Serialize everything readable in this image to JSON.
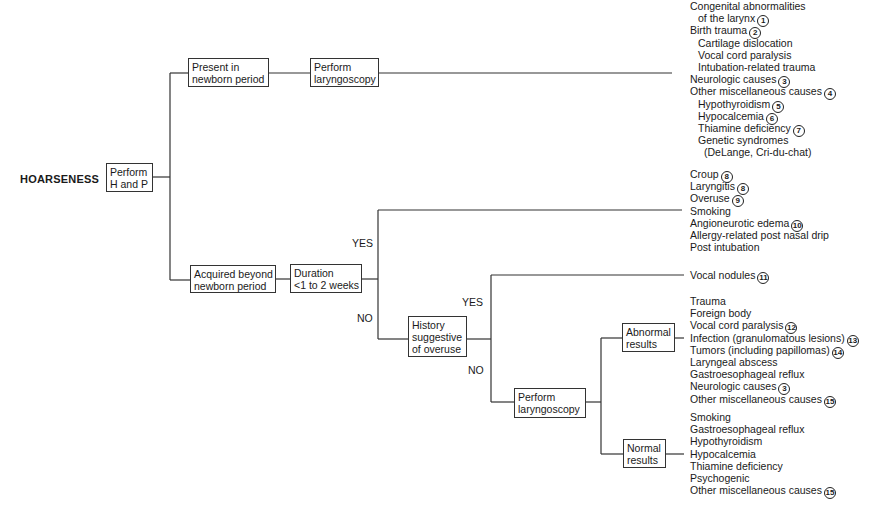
{
  "diagram": {
    "title": "HOARSENESS",
    "nodes": {
      "h_and_p": [
        "Perform",
        "H and P"
      ],
      "newborn": [
        "Present in",
        "newborn period"
      ],
      "newborn_laryngoscopy": [
        "Perform",
        "laryngoscopy"
      ],
      "acquired": [
        "Acquired beyond",
        "newborn period"
      ],
      "duration": [
        "Duration",
        "<1 to 2 weeks"
      ],
      "history": [
        "History",
        "suggestive",
        "of overuse"
      ],
      "laryngoscopy2": [
        "Perform",
        "laryngoscopy"
      ],
      "abnormal": [
        "Abnormal",
        "results"
      ],
      "normal": [
        "Normal",
        "results"
      ]
    },
    "edge_labels": {
      "duration_yes": "YES",
      "duration_no": "NO",
      "history_yes": "YES",
      "history_no": "NO"
    },
    "outcomes": {
      "newborn": [
        {
          "text": "Congenital abnormalities",
          "indent": 0,
          "ref": ""
        },
        {
          "text": "of the larynx",
          "indent": 1,
          "ref": "1"
        },
        {
          "text": "Birth trauma",
          "indent": 0,
          "ref": "2"
        },
        {
          "text": "Cartilage dislocation",
          "indent": 1,
          "ref": ""
        },
        {
          "text": "Vocal cord paralysis",
          "indent": 1,
          "ref": ""
        },
        {
          "text": "Intubation-related trauma",
          "indent": 1,
          "ref": ""
        },
        {
          "text": "Neurologic causes",
          "indent": 0,
          "ref": "3"
        },
        {
          "text": "Other miscellaneous causes",
          "indent": 0,
          "ref": "4"
        },
        {
          "text": "Hypothyroidism",
          "indent": 1,
          "ref": "5"
        },
        {
          "text": "Hypocalcemia",
          "indent": 1,
          "ref": "6"
        },
        {
          "text": "Thiamine deficiency",
          "indent": 1,
          "ref": "7"
        },
        {
          "text": "Genetic syndromes",
          "indent": 1,
          "ref": ""
        },
        {
          "text": "(DeLange, Cri-du-chat)",
          "indent": 2,
          "ref": ""
        }
      ],
      "short_duration": [
        {
          "text": "Croup",
          "indent": 0,
          "ref": "8"
        },
        {
          "text": "Laryngitis",
          "indent": 0,
          "ref": "8"
        },
        {
          "text": "Overuse",
          "indent": 0,
          "ref": "9"
        },
        {
          "text": "Smoking",
          "indent": 0,
          "ref": ""
        },
        {
          "text": "Angioneurotic edema",
          "indent": 0,
          "ref": "10"
        },
        {
          "text": "Allergy-related post nasal drip",
          "indent": 0,
          "ref": ""
        },
        {
          "text": "Post intubation",
          "indent": 0,
          "ref": ""
        }
      ],
      "overuse": [
        {
          "text": "Vocal nodules",
          "indent": 0,
          "ref": "11"
        }
      ],
      "abnormal": [
        {
          "text": "Trauma",
          "indent": 0,
          "ref": ""
        },
        {
          "text": "Foreign body",
          "indent": 0,
          "ref": ""
        },
        {
          "text": "Vocal cord paralysis",
          "indent": 0,
          "ref": "12"
        },
        {
          "text": "Infection (granulomatous lesions)",
          "indent": 0,
          "ref": "13"
        },
        {
          "text": "Tumors (including papillomas)",
          "indent": 0,
          "ref": "14"
        },
        {
          "text": "Laryngeal abscess",
          "indent": 0,
          "ref": ""
        },
        {
          "text": "Gastroesophageal reflux",
          "indent": 0,
          "ref": ""
        },
        {
          "text": "Neurologic causes",
          "indent": 0,
          "ref": "3"
        },
        {
          "text": "Other miscellaneous causes",
          "indent": 0,
          "ref": "15"
        }
      ],
      "normal": [
        {
          "text": "Smoking",
          "indent": 0,
          "ref": ""
        },
        {
          "text": "Gastroesophageal reflux",
          "indent": 0,
          "ref": ""
        },
        {
          "text": "Hypothyroidism",
          "indent": 0,
          "ref": ""
        },
        {
          "text": "Hypocalcemia",
          "indent": 0,
          "ref": ""
        },
        {
          "text": "Thiamine deficiency",
          "indent": 0,
          "ref": ""
        },
        {
          "text": "Psychogenic",
          "indent": 0,
          "ref": ""
        },
        {
          "text": "Other miscellaneous causes",
          "indent": 0,
          "ref": "15"
        }
      ]
    },
    "colors": {
      "line": "#333333",
      "text": "#1a1a1a",
      "background": "#ffffff"
    }
  }
}
